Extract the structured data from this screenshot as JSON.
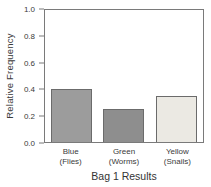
{
  "chart_data": {
    "type": "bar",
    "title": "Bag 1 Results",
    "xlabel": "",
    "ylabel": "Relative Frequency",
    "ylim": [
      0,
      1.0
    ],
    "yticks": [
      1.0,
      0.8,
      0.6,
      0.4,
      0.2,
      0.0
    ],
    "ytick_labels": [
      "1.0",
      "0.8",
      "0.6",
      "0.4",
      "0.2",
      "0.0"
    ],
    "categories": [
      "Blue",
      "Green",
      "Yellow"
    ],
    "category_sublabels": [
      "(Flies)",
      "(Worms)",
      "(Snails)"
    ],
    "values": [
      0.4,
      0.25,
      0.35
    ],
    "grid": false,
    "legend": false,
    "colors": {
      "bar_fills": [
        "#9c9c9c",
        "#8e8e8e",
        "#ebe9e3"
      ],
      "bar_border": "#6b6b6b",
      "axis_border": "#7a7a7a",
      "text": "#3a3a3a"
    }
  }
}
